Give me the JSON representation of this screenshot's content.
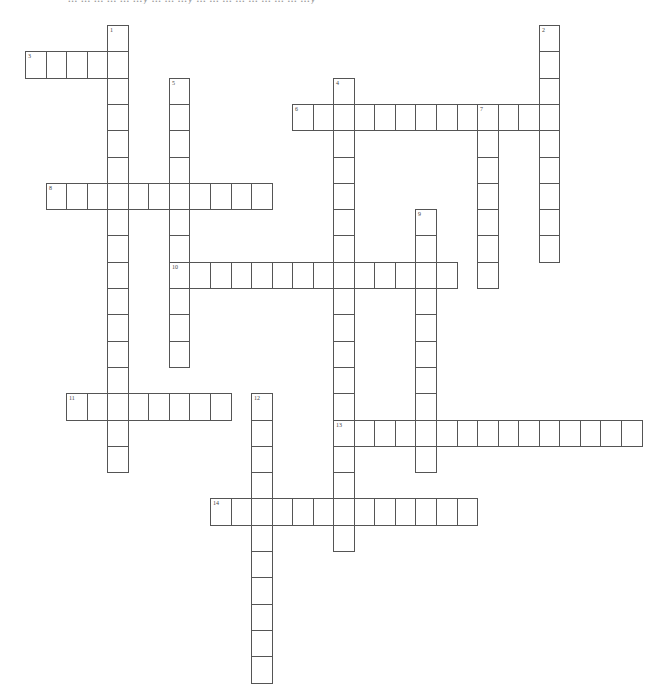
{
  "page": {
    "heading_cutoff": "... ... ... ... ... ...y ... ... ...y ... ... ... ... ... ... ... ... ...y"
  },
  "grid": {
    "origin_x": 25,
    "origin_y": 25,
    "cell_w": 20.55,
    "cell_h": 26.3,
    "border_color": "#555555",
    "words": [
      {
        "number": "1",
        "direction": "down",
        "col": 4,
        "row": 0,
        "length": 17
      },
      {
        "number": "2",
        "direction": "down",
        "col": 25,
        "row": 0,
        "length": 9
      },
      {
        "number": "3",
        "direction": "across",
        "col": 0,
        "row": 1,
        "length": 5
      },
      {
        "number": "4",
        "direction": "down",
        "col": 15,
        "row": 2,
        "length": 18
      },
      {
        "number": "5",
        "direction": "down",
        "col": 7,
        "row": 2,
        "length": 11
      },
      {
        "number": "6",
        "direction": "across",
        "col": 13,
        "row": 3,
        "length": 13
      },
      {
        "number": "7",
        "direction": "down",
        "col": 22,
        "row": 3,
        "length": 7
      },
      {
        "number": "8",
        "direction": "across",
        "col": 1,
        "row": 6,
        "length": 11
      },
      {
        "number": "9",
        "direction": "down",
        "col": 19,
        "row": 7,
        "length": 10
      },
      {
        "number": "10",
        "direction": "across",
        "col": 7,
        "row": 9,
        "length": 14
      },
      {
        "number": "11",
        "direction": "across",
        "col": 2,
        "row": 14,
        "length": 8
      },
      {
        "number": "12",
        "direction": "down",
        "col": 11,
        "row": 14,
        "length": 11
      },
      {
        "number": "13",
        "direction": "across",
        "col": 15,
        "row": 15,
        "length": 15
      },
      {
        "number": "14",
        "direction": "across",
        "col": 9,
        "row": 18,
        "length": 13
      }
    ]
  }
}
